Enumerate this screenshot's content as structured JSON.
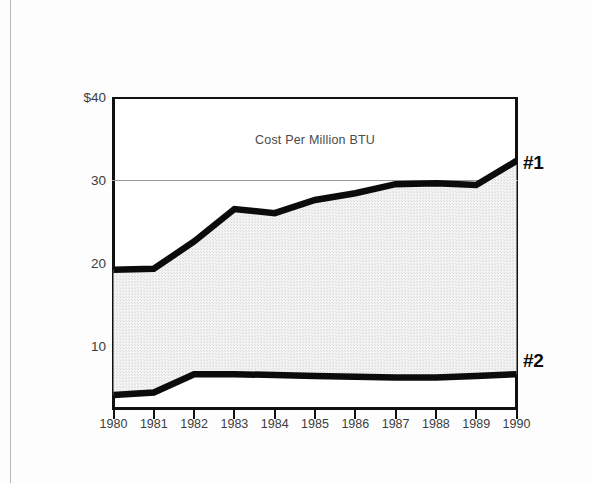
{
  "chart_data": {
    "type": "area",
    "title": "Cost Per Million BTU",
    "xlabel": "",
    "ylabel": "",
    "ylim": [
      0,
      40
    ],
    "xlim": [
      1980,
      1990
    ],
    "grid": "single horizontal gridline at 30",
    "legend_position": "right-of-plot callouts",
    "yticks": [
      "$40",
      "30",
      "20",
      "10"
    ],
    "ytick_values": [
      40,
      30,
      20,
      10
    ],
    "categories": [
      1980,
      1981,
      1982,
      1983,
      1984,
      1985,
      1986,
      1987,
      1988,
      1989,
      1990
    ],
    "xtick_labels": [
      "1980",
      "1981",
      "1982",
      "1983",
      "1984",
      "1985",
      "1986",
      "1987",
      "1988",
      "1989",
      "1990"
    ],
    "series": [
      {
        "name": "#1",
        "label": "#1",
        "color": "#0b0b0b",
        "values": [
          19.2,
          19.3,
          22.6,
          26.5,
          26.0,
          27.6,
          28.4,
          29.5,
          29.6,
          29.4,
          32.3
        ]
      },
      {
        "name": "#2",
        "label": "#2",
        "color": "#0b0b0b",
        "values": [
          4.1,
          4.4,
          6.6,
          6.6,
          6.5,
          6.4,
          6.3,
          6.2,
          6.2,
          6.4,
          6.6
        ]
      }
    ],
    "band_fill": "#ececec",
    "band_description": "shaded band between series #1 (upper) and series #2 (lower)"
  },
  "figure": {
    "title": "Cost Per Million BTU",
    "series_label_1": "#1",
    "series_label_2": "#2"
  },
  "colors": {
    "line": "#0b0b0b",
    "fill": "#ececec",
    "grid": "#9a9a9a",
    "axis": "#111111",
    "text": "#3c3c3c",
    "page": "#fdfdfd"
  }
}
